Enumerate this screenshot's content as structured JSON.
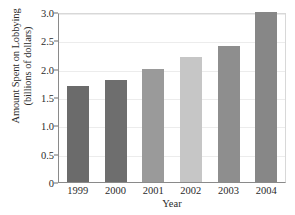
{
  "chart_data": {
    "type": "bar",
    "title": "",
    "categories": [
      "1999",
      "2000",
      "2001",
      "2002",
      "2003",
      "2004"
    ],
    "values": [
      1.7,
      1.8,
      2.0,
      2.2,
      2.4,
      3.0
    ],
    "xlabel": "Year",
    "ylabel": "Amount Spent on Lobbying (billions of dollars)",
    "ylabel_line1": "Amount Spent on Lobbying",
    "ylabel_line2": "(billions of dollars)",
    "ylim": [
      0,
      3.0
    ],
    "yticks": [
      0,
      0.5,
      1.0,
      1.5,
      2.0,
      2.5,
      3.0
    ],
    "ytick_labels": [
      "0",
      "0.5",
      "1.0",
      "1.5",
      "2.0",
      "2.5",
      "3.0"
    ],
    "grid": true,
    "legend": "none",
    "bar_colors": [
      "#6b6b6b",
      "#6e6e6e",
      "#9a9a9a",
      "#c6c6c6",
      "#8e8e8e",
      "#878787"
    ],
    "gridline_color": "#ececec",
    "axis_color": "#8a8a8a"
  }
}
